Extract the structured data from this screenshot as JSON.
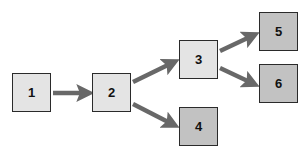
{
  "diagram": {
    "type": "flow",
    "colors": {
      "arrow": "#686868",
      "border": "#2a2a2a",
      "light_fill": "#e4e4e4",
      "dark_fill": "#c2c2c2",
      "text": "#111111"
    },
    "nodes": [
      {
        "id": "1",
        "label": "1",
        "shade": "light"
      },
      {
        "id": "2",
        "label": "2",
        "shade": "light"
      },
      {
        "id": "3",
        "label": "3",
        "shade": "light"
      },
      {
        "id": "4",
        "label": "4",
        "shade": "dark"
      },
      {
        "id": "5",
        "label": "5",
        "shade": "dark"
      },
      {
        "id": "6",
        "label": "6",
        "shade": "dark"
      }
    ],
    "edges": [
      {
        "from": "1",
        "to": "2"
      },
      {
        "from": "2",
        "to": "3"
      },
      {
        "from": "2",
        "to": "4"
      },
      {
        "from": "3",
        "to": "5"
      },
      {
        "from": "3",
        "to": "6"
      }
    ]
  }
}
